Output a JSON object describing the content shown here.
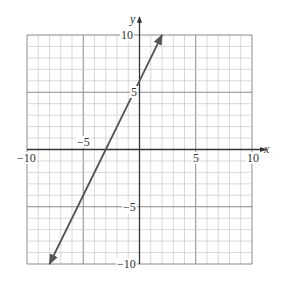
{
  "chart_data": {
    "type": "line",
    "title": "",
    "xlabel": "x",
    "ylabel": "y",
    "xlim": [
      -10,
      10
    ],
    "ylim": [
      -10,
      10
    ],
    "grid": true,
    "minor_grid_step": 1,
    "major_grid_step": 5,
    "x_ticks": [
      {
        "value": -10,
        "label": "−10"
      },
      {
        "value": -5,
        "label": "−5"
      },
      {
        "value": 5,
        "label": "5"
      },
      {
        "value": 10,
        "label": "10"
      }
    ],
    "y_ticks": [
      {
        "value": 10,
        "label": "10"
      },
      {
        "value": 5,
        "label": "5"
      },
      {
        "value": -5,
        "label": "−5"
      },
      {
        "value": -10,
        "label": "−10"
      }
    ],
    "series": [
      {
        "name": "y = 2x + 6",
        "equation": "y = 2x + 6",
        "x": [
          -8,
          -3,
          0,
          2
        ],
        "y": [
          -10,
          0,
          6,
          10
        ],
        "arrows": "both",
        "color": "#555555"
      }
    ],
    "legend": null
  },
  "colors": {
    "minor_grid": "#c8c8c8",
    "major_grid": "#8a8a8a",
    "axis": "#333333",
    "line": "#555555"
  }
}
